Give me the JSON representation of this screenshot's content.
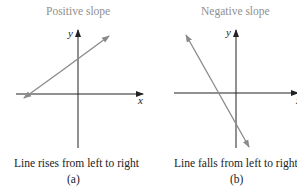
{
  "panels": [
    {
      "title": "Positive slope",
      "caption": "Line rises from left to right",
      "label": "(a)",
      "x_axis_label": "x",
      "y_axis_label": "y",
      "line_color": "#8a8a8a"
    },
    {
      "title": "Negative slope",
      "caption": "Line falls from left to right",
      "label": "(b)",
      "x_axis_label": "x",
      "y_axis_label": "y",
      "line_color": "#8a8a8a"
    }
  ],
  "colors": {
    "axis": "#222222",
    "line": "#8a8a8a",
    "title": "#8f8f8f"
  }
}
